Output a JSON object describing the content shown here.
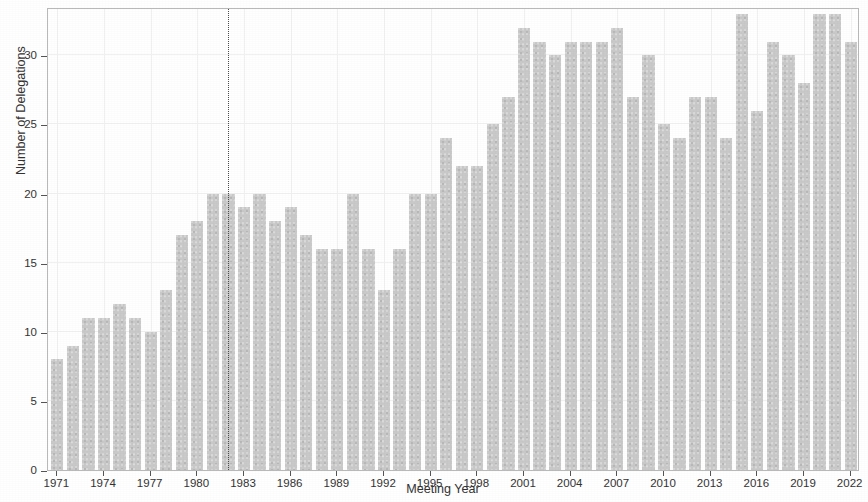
{
  "chart_data": {
    "type": "bar",
    "title": "",
    "xlabel": "Meeting Year",
    "ylabel": "Number of Delegations",
    "xlim": [
      1970.4,
      2022.6
    ],
    "ylim": [
      0,
      33.5
    ],
    "grid": true,
    "legend": null,
    "bar_color": "#c9c9c9",
    "annotations": [
      {
        "type": "vertical-dotted-line",
        "x": 1982,
        "label": ""
      }
    ],
    "x_tick_labels": [
      "1971",
      "1974",
      "1977",
      "1980",
      "1983",
      "1986",
      "1989",
      "1992",
      "1995",
      "1998",
      "2001",
      "2004",
      "2007",
      "2010",
      "2013",
      "2016",
      "2019",
      "2022"
    ],
    "x_tick_values": [
      1971,
      1974,
      1977,
      1980,
      1983,
      1986,
      1989,
      1992,
      1995,
      1998,
      2001,
      2004,
      2007,
      2010,
      2013,
      2016,
      2019,
      2022
    ],
    "y_tick_labels": [
      "0",
      "5",
      "10",
      "15",
      "20",
      "25",
      "30"
    ],
    "y_tick_values": [
      0,
      5,
      10,
      15,
      20,
      25,
      30
    ],
    "categories": [
      1971,
      1972,
      1973,
      1974,
      1975,
      1976,
      1977,
      1978,
      1979,
      1980,
      1981,
      1982,
      1983,
      1984,
      1985,
      1986,
      1987,
      1988,
      1989,
      1990,
      1991,
      1992,
      1993,
      1994,
      1995,
      1996,
      1997,
      1998,
      1999,
      2000,
      2001,
      2002,
      2003,
      2004,
      2005,
      2006,
      2007,
      2008,
      2009,
      2010,
      2011,
      2012,
      2013,
      2014,
      2015,
      2016,
      2017,
      2018,
      2019,
      2020,
      2021,
      2022
    ],
    "values": [
      8,
      9,
      11,
      11,
      12,
      11,
      10,
      13,
      17,
      18,
      20,
      20,
      19,
      20,
      18,
      19,
      17,
      16,
      16,
      20,
      16,
      13,
      16,
      20,
      20,
      24,
      22,
      22,
      25,
      27,
      32,
      31,
      30,
      31,
      31,
      31,
      32,
      27,
      30,
      25,
      24,
      27,
      27,
      24,
      33,
      26,
      31,
      30,
      28,
      33,
      33,
      31
    ]
  }
}
